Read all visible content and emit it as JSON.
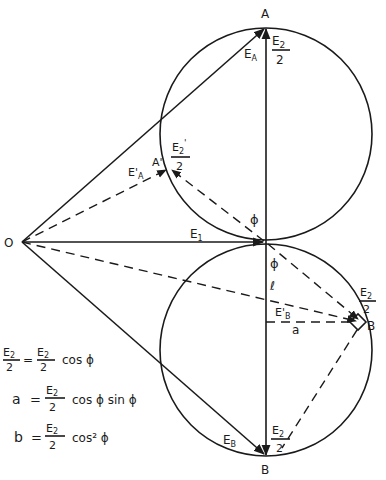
{
  "diagram": {
    "points": {
      "O": "O",
      "A": "A",
      "A_prime": "A'",
      "B_top_right": "B'",
      "B_bottom": "B"
    },
    "vectors": {
      "E1": "E",
      "E1_sub": "1",
      "EA": "E",
      "EA_sub": "A",
      "EA_prime": "E'",
      "EA_prime_sub": "A",
      "EB": "E",
      "EB_sub": "B",
      "EB_prime": "E'",
      "EB_prime_sub": "B"
    },
    "labels": {
      "E2": "E",
      "E2_sub": "2",
      "E2_prime": "E",
      "E2_prime_sub": "2",
      "E2_prime_mark": "'",
      "half_denominator": "2",
      "phi": "ϕ",
      "l": "ℓ",
      "a": "a"
    },
    "equations": [
      {
        "lhs_num": "E",
        "lhs_num_sub": "2",
        "lhs_prime": "'",
        "lhs_den": "2",
        "eq": "=",
        "rhs_num": "E",
        "rhs_num_sub": "2",
        "rhs_den": "2",
        "tail": "cos ϕ"
      },
      {
        "lhs": "a",
        "eq": "=",
        "rhs_num": "E",
        "rhs_num_sub": "2",
        "rhs_den": "2",
        "tail": "cos ϕ sin ϕ"
      },
      {
        "lhs": "b",
        "eq": "=",
        "rhs_num": "E",
        "rhs_num_sub": "2",
        "rhs_den": "2",
        "tail": "cos² ϕ"
      }
    ]
  }
}
